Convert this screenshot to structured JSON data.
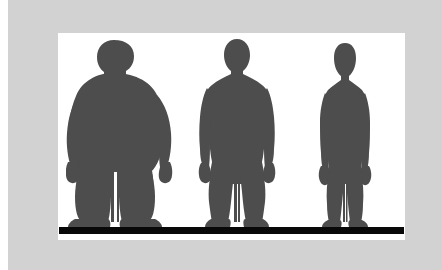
{
  "image": {
    "title": "Three human body-type silhouettes",
    "caption": "",
    "frame_color": "#d2d2d2",
    "panel_color": "#ffffff",
    "ground_color": "#080808",
    "silhouette_color": "#4d4d4d",
    "outer_gutter_color": "#ffffff"
  },
  "panel": {
    "ground_label": "ground-line",
    "background_label": "white-backdrop"
  },
  "figures": [
    {
      "id": "obese",
      "label": "Obese body silhouette",
      "position": "left",
      "build": "obese",
      "color": "#4d4d4d",
      "relative_height": 1.0,
      "relative_width": 1.0
    },
    {
      "id": "average",
      "label": "Athletic / average body silhouette",
      "position": "center",
      "build": "athletic",
      "color": "#4d4d4d",
      "relative_height": 1.0,
      "relative_width": 0.58
    },
    {
      "id": "slim",
      "label": "Slim body silhouette",
      "position": "right",
      "build": "slim",
      "color": "#4d4d4d",
      "relative_height": 0.97,
      "relative_width": 0.42
    }
  ]
}
